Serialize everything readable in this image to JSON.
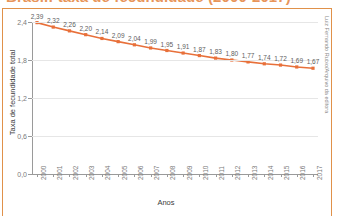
{
  "title": "Brasil: taxa de fecundidade (2000-2017)",
  "credit": "Luiz Fernando Rubio/Arquivo da editora",
  "chart_data": {
    "type": "line",
    "title": "Brasil: taxa de fecundidade (2000-2017)",
    "xlabel": "Anos",
    "ylabel": "Taxa de fecundidade total",
    "categories": [
      "2000",
      "2001",
      "2002",
      "2003",
      "2004",
      "2005",
      "2006",
      "2007",
      "2008",
      "2009",
      "2010",
      "2011",
      "2012",
      "2013",
      "2014",
      "2015",
      "2016",
      "2017"
    ],
    "values": [
      2.39,
      2.32,
      2.26,
      2.2,
      2.14,
      2.09,
      2.04,
      1.99,
      1.95,
      1.91,
      1.87,
      1.83,
      1.8,
      1.77,
      1.74,
      1.72,
      1.69,
      1.67
    ],
    "point_labels": [
      "2,39",
      "2,32",
      "2,26",
      "2,20",
      "2,14",
      "2,09",
      "2,04",
      "1,99",
      "1,95",
      "1,91",
      "1,87",
      "1,83",
      "1,80",
      "1,77",
      "1,74",
      "1,72",
      "1,69",
      "1,67"
    ],
    "ylim": [
      0.0,
      2.4
    ],
    "yticks": [
      0.0,
      0.6,
      1.2,
      1.8,
      2.4
    ],
    "ytick_labels": [
      "0,0",
      "0,6",
      "1,2",
      "1,8",
      "2,4"
    ],
    "grid": true,
    "legend": "none",
    "series_color": "#E8703A",
    "marker": "square",
    "marker_color": "#E8703A"
  }
}
